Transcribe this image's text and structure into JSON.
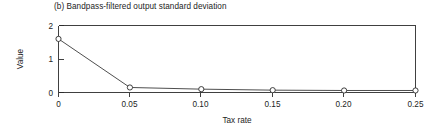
{
  "chart_data": {
    "type": "line",
    "title": "(b) Bandpass-filtered output standard deviation",
    "xlabel": "Tax rate",
    "ylabel": "Value",
    "x": [
      0,
      0.05,
      0.1,
      0.15,
      0.2,
      0.25
    ],
    "values": [
      1.6,
      0.15,
      0.1,
      0.07,
      0.06,
      0.06
    ],
    "series": [
      {
        "name": "Bandpass-filtered output standard deviation",
        "values": [
          1.6,
          0.15,
          0.1,
          0.07,
          0.06,
          0.06
        ]
      }
    ],
    "xticks": [
      0,
      0.05,
      0.1,
      0.15,
      0.2,
      0.25
    ],
    "xticklabels": [
      "0",
      "0.05",
      "0.10",
      "0.15",
      "0.20",
      "0.25"
    ],
    "yticks": [
      0,
      1,
      2
    ],
    "yticklabels": [
      "0",
      "1",
      "2"
    ],
    "xlim": [
      0,
      0.25
    ],
    "ylim": [
      0,
      2
    ],
    "grid": false,
    "legend": false,
    "marker": "open-circle",
    "line_color": "#3a3a3a",
    "marker_face_color": "#ffffff",
    "background_color": "#ffffff"
  },
  "figure": {
    "panel_label": "(b)",
    "title_text": "(b) Bandpass-filtered output standard deviation"
  },
  "axes": {
    "x_title": "Tax rate",
    "y_title": "Value",
    "x_tick_0": "0",
    "x_tick_1": "0.05",
    "x_tick_2": "0.10",
    "x_tick_3": "0.15",
    "x_tick_4": "0.20",
    "x_tick_5": "0.25",
    "y_tick_0": "0",
    "y_tick_1": "1",
    "y_tick_2": "2"
  }
}
